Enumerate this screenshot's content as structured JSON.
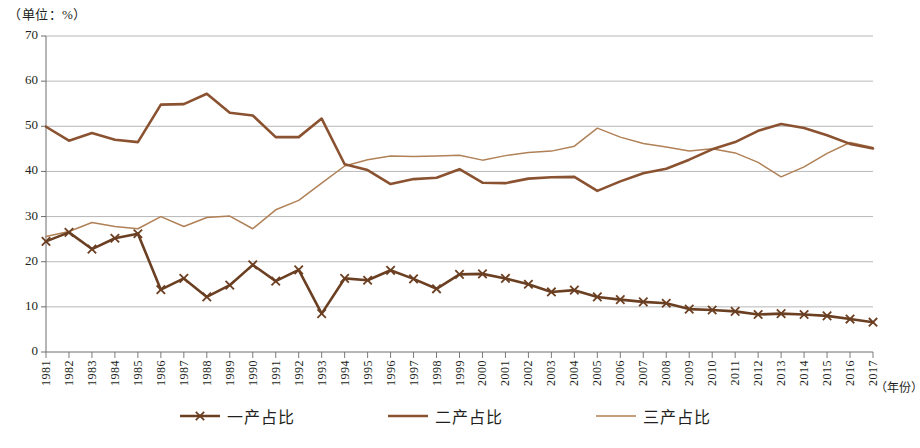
{
  "chart_data": {
    "type": "line",
    "title": "",
    "unit_label": "（单位：%）",
    "xlabel": "（年份）",
    "ylabel": "",
    "grid": true,
    "legend_position": "bottom",
    "ylim": [
      0,
      70
    ],
    "yticks": [
      0,
      10,
      20,
      30,
      40,
      50,
      60,
      70
    ],
    "categories": [
      "1981",
      "1982",
      "1983",
      "1984",
      "1985",
      "1986",
      "1987",
      "1988",
      "1989",
      "1990",
      "1991",
      "1992",
      "1993",
      "1994",
      "1995",
      "1996",
      "1997",
      "1998",
      "1999",
      "2000",
      "2001",
      "2002",
      "2003",
      "2004",
      "2005",
      "2006",
      "2007",
      "2008",
      "2009",
      "2010",
      "2011",
      "2012",
      "2013",
      "2014",
      "2015",
      "2016",
      "2017"
    ],
    "series": [
      {
        "name": "一产占比",
        "color": "#6b3f22",
        "marker": "x",
        "width": 2.6,
        "values": [
          24.5,
          26.5,
          22.8,
          25.2,
          26.2,
          13.8,
          16.3,
          12.2,
          14.8,
          19.3,
          15.7,
          18.2,
          8.5,
          16.3,
          15.9,
          18.1,
          16.2,
          14.0,
          17.2,
          17.3,
          16.3,
          15.0,
          13.3,
          13.7,
          12.2,
          11.6,
          11.1,
          10.8,
          9.5,
          9.3,
          9.0,
          8.3,
          8.5,
          8.3,
          8.0,
          7.3,
          6.6
        ]
      },
      {
        "name": "二产占比",
        "color": "#8a5230",
        "marker": "none",
        "width": 2.6,
        "values": [
          49.9,
          46.8,
          48.5,
          47.0,
          46.5,
          54.8,
          54.9,
          57.2,
          53.0,
          52.4,
          47.6,
          47.6,
          51.7,
          41.6,
          40.3,
          37.2,
          38.3,
          38.6,
          40.5,
          37.5,
          37.4,
          38.4,
          38.7,
          38.8,
          35.7,
          37.8,
          39.6,
          40.6,
          42.6,
          44.9,
          46.5,
          49.0,
          50.5,
          49.6,
          48.0,
          46.1,
          45.1
        ]
      },
      {
        "name": "三产占比",
        "color": "#b08157",
        "marker": "none",
        "width": 1.5,
        "values": [
          25.6,
          26.7,
          28.7,
          27.8,
          27.3,
          30.0,
          27.8,
          29.8,
          30.1,
          27.3,
          31.5,
          33.6,
          37.4,
          41.2,
          42.6,
          43.4,
          43.3,
          43.4,
          43.6,
          42.5,
          43.5,
          44.2,
          44.5,
          45.6,
          49.6,
          47.6,
          46.2,
          45.4,
          44.5,
          45.0,
          44.1,
          42.0,
          38.8,
          41.0,
          44.0,
          46.4,
          45.3
        ]
      }
    ]
  }
}
